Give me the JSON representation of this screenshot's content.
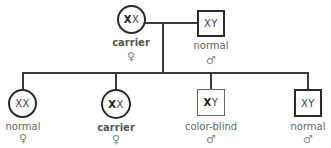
{
  "pedigree": {
    "parents": {
      "mother": {
        "genotype_bold": "X",
        "genotype_rest": "X",
        "status": "carrier",
        "sex_symbol": "♀"
      },
      "father": {
        "genotype_bold": "",
        "genotype_rest": "XY",
        "status": "normal",
        "sex_symbol": "♂"
      }
    },
    "children": [
      {
        "genotype_bold": "",
        "genotype_rest": "XX",
        "status": "normal",
        "sex_symbol": "♀"
      },
      {
        "genotype_bold": "X",
        "genotype_rest": "X",
        "status": "carrier",
        "sex_symbol": "♀"
      },
      {
        "genotype_bold": "X",
        "genotype_rest": "Y",
        "status": "color-blind",
        "sex_symbol": "♂"
      },
      {
        "genotype_bold": "",
        "genotype_rest": "XY",
        "status": "normal",
        "sex_symbol": "♂"
      }
    ]
  }
}
